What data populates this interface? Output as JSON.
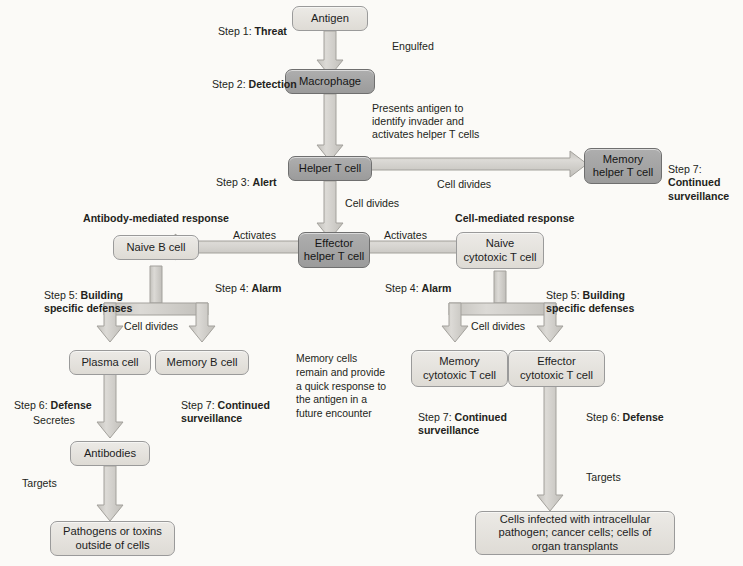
{
  "diagram": {
    "colors": {
      "background": "#fbfaf7",
      "node_light": "#e6e3de",
      "node_dark": "#a5a5a5",
      "node_border": "#9a9a9a",
      "arrow_fill": "#cfcdc8",
      "arrow_stroke": "#9d9b96",
      "text": "#231f20"
    },
    "nodes": [
      {
        "id": "antigen",
        "label": "Antigen",
        "tone": "light"
      },
      {
        "id": "macrophage",
        "label": "Macrophage",
        "tone": "dark"
      },
      {
        "id": "helper-t-cell",
        "label": "Helper T cell",
        "tone": "dark"
      },
      {
        "id": "memory-helper-t-cell",
        "label": "Memory\nhelper T cell",
        "tone": "dark"
      },
      {
        "id": "effector-helper-t-cell",
        "label": "Effector\nhelper T cell",
        "tone": "dark"
      },
      {
        "id": "naive-b-cell",
        "label": "Naive B cell",
        "tone": "light"
      },
      {
        "id": "naive-cytotoxic-t-cell",
        "label": "Naive\ncytotoxic T cell",
        "tone": "light"
      },
      {
        "id": "plasma-cell",
        "label": "Plasma cell",
        "tone": "light"
      },
      {
        "id": "memory-b-cell",
        "label": "Memory B cell",
        "tone": "light"
      },
      {
        "id": "memory-cytotoxic-t-cell",
        "label": "Memory\ncytotoxic T cell",
        "tone": "light"
      },
      {
        "id": "effector-cytotoxic-t-cell",
        "label": "Effector\ncytotoxic T cell",
        "tone": "light"
      },
      {
        "id": "antibodies",
        "label": "Antibodies",
        "tone": "light"
      },
      {
        "id": "pathogens-or-toxins",
        "label": "Pathogens or toxins\noutside of cells",
        "tone": "light"
      },
      {
        "id": "infected-cells",
        "label": "Cells infected with intracellular\npathogen; cancer cells; cells of\norgan transplants",
        "tone": "light"
      }
    ],
    "step_labels": {
      "step1": "Step 1: Threat",
      "step1_prefix": "Step 1: ",
      "step1_name": "Threat",
      "step2_prefix": "Step 2: ",
      "step2_name": "Detection",
      "step3_prefix": "Step 3: ",
      "step3_name": "Alert",
      "step4_left_prefix": "Step 4: ",
      "step4_left_name": "Alarm",
      "step4_right_prefix": "Step 4: ",
      "step4_right_name": "Alarm",
      "step5_left_prefix": "Step 5: ",
      "step5_left_name": "Building\nspecific defenses",
      "step5_right_prefix": "Step 5: ",
      "step5_right_name": "Building\nspecific defenses",
      "step6_left_prefix": "Step 6: ",
      "step6_left_name": "Defense",
      "step6_right_prefix": "Step 6: ",
      "step6_right_name": "Defense",
      "step7_top_prefix": "Step 7: ",
      "step7_top_name": "Continued\nsurveillance",
      "step7_left_prefix": "Step 7: ",
      "step7_left_name": "Continued\nsurveillance",
      "step7_right_prefix": "Step 7: ",
      "step7_right_name": "Continued\nsurveillance"
    },
    "branch_headings": {
      "antibody_mediated": "Antibody-mediated response",
      "cell_mediated": "Cell-mediated response"
    },
    "edge_labels": {
      "engulfed": "Engulfed",
      "presents_antigen": "Presents antigen to\nidentify invader and\nactivates helper T cells",
      "cell_divides_memory_helper": "Cell divides",
      "cell_divides_effector_helper": "Cell divides",
      "activates_left": "Activates",
      "activates_right": "Activates",
      "cell_divides_b": "Cell divides",
      "cell_divides_t": "Cell divides",
      "secretes": "Secretes",
      "targets_left": "Targets",
      "targets_right": "Targets"
    },
    "notes": {
      "memory_cells": "Memory cells\nremain and provide\na quick response to\nthe antigen in a\nfuture encounter"
    }
  }
}
